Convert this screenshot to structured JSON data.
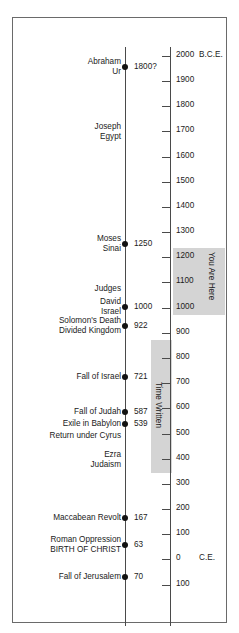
{
  "figure": {
    "width": 239,
    "height": 633,
    "background": "#ffffff",
    "border_color": "#6a6a6a",
    "band_color": "#d4d4d4",
    "axis_color": "#4a4a4a",
    "text_color": "#1b1b1b"
  },
  "chart_data": {
    "type": "timeline",
    "orientation": "vertical",
    "direction": "top-is-oldest",
    "axis": {
      "label_top": "2000 B.C.E.",
      "label_zero": "C.E.",
      "range_start": 2000,
      "range_end": -100,
      "unit": "years",
      "tick_interval": 100,
      "grid": false
    },
    "ticks": [
      {
        "value": 2000,
        "label": "2000",
        "era": "B.C.E.",
        "y": 55
      },
      {
        "value": 1900,
        "label": "1900",
        "era": "",
        "y": 80
      },
      {
        "value": 1800,
        "label": "1800",
        "era": "",
        "y": 105
      },
      {
        "value": 1700,
        "label": "1700",
        "era": "",
        "y": 130
      },
      {
        "value": 1600,
        "label": "1600",
        "era": "",
        "y": 156
      },
      {
        "value": 1500,
        "label": "1500",
        "era": "",
        "y": 181
      },
      {
        "value": 1400,
        "label": "1400",
        "era": "",
        "y": 206
      },
      {
        "value": 1300,
        "label": "1300",
        "era": "",
        "y": 231
      },
      {
        "value": 1200,
        "label": "1200",
        "era": "",
        "y": 256
      },
      {
        "value": 1100,
        "label": "1100",
        "era": "",
        "y": 281
      },
      {
        "value": 1000,
        "label": "1000",
        "era": "",
        "y": 307
      },
      {
        "value": 900,
        "label": "900",
        "era": "",
        "y": 332
      },
      {
        "value": 800,
        "label": "800",
        "era": "",
        "y": 357
      },
      {
        "value": 700,
        "label": "700",
        "era": "",
        "y": 382
      },
      {
        "value": 600,
        "label": "600",
        "era": "",
        "y": 407
      },
      {
        "value": 500,
        "label": "500",
        "era": "",
        "y": 433
      },
      {
        "value": 400,
        "label": "400",
        "era": "",
        "y": 458
      },
      {
        "value": 300,
        "label": "300",
        "era": "",
        "y": 483
      },
      {
        "value": 200,
        "label": "200",
        "era": "",
        "y": 508
      },
      {
        "value": 100,
        "label": "100",
        "era": "",
        "y": 533
      },
      {
        "value": 0,
        "label": "0",
        "era": "C.E.",
        "y": 558
      },
      {
        "value": -100,
        "label": "100",
        "era": "",
        "y": 584
      }
    ],
    "events": [
      {
        "line1": "Abraham",
        "line2": "Ur",
        "date": "1800?",
        "value": 1800,
        "dot": true,
        "y": 66
      },
      {
        "line1": "Joseph",
        "line2": "Egypt",
        "date": "",
        "value": 1700,
        "dot": false,
        "y": 131
      },
      {
        "line1": "Moses",
        "line2": "Sinai",
        "date": "1250",
        "value": 1250,
        "dot": true,
        "y": 243
      },
      {
        "line1": "Judges",
        "line2": "",
        "date": "",
        "value": 1150,
        "dot": false,
        "y": 288
      },
      {
        "line1": "David",
        "line2": "Israel",
        "date": "1000",
        "value": 1000,
        "dot": true,
        "y": 306
      },
      {
        "line1": "Solomon's Death",
        "line2": "Divided Kingdom",
        "date": "922",
        "value": 922,
        "dot": true,
        "y": 325
      },
      {
        "line1": "Fall of Israel",
        "line2": "",
        "date": "721",
        "value": 721,
        "dot": true,
        "y": 376
      },
      {
        "line1": "Fall of Judah",
        "line2": "",
        "date": "587",
        "value": 587,
        "dot": true,
        "y": 411
      },
      {
        "line1": "Exile in Babylon",
        "line2": "",
        "date": "539",
        "value": 539,
        "dot": true,
        "y": 423
      },
      {
        "line1": "Return under Cyrus",
        "line2": "",
        "date": "",
        "value": 538,
        "dot": false,
        "y": 435
      },
      {
        "line1": "Ezra",
        "line2": "Judaism",
        "date": "",
        "value": 450,
        "dot": false,
        "y": 459
      },
      {
        "line1": "Maccabean Revolt",
        "line2": "",
        "date": "167",
        "value": 167,
        "dot": true,
        "y": 517
      },
      {
        "line1": "Roman Oppression",
        "line2": "BIRTH OF CHRIST",
        "date": "63",
        "value": 63,
        "dot": true,
        "y": 544
      },
      {
        "line1": "Fall of Jerusalem",
        "line2": "",
        "date": "70",
        "value": -70,
        "dot": true,
        "y": 576
      }
    ],
    "bands": [
      {
        "name": "you-are-here",
        "label": "You Are Here",
        "from": 1320,
        "to": 1000,
        "side": "right"
      },
      {
        "name": "time-written",
        "label": "Time Written",
        "from": 950,
        "to": 420,
        "side": "left"
      }
    ]
  }
}
